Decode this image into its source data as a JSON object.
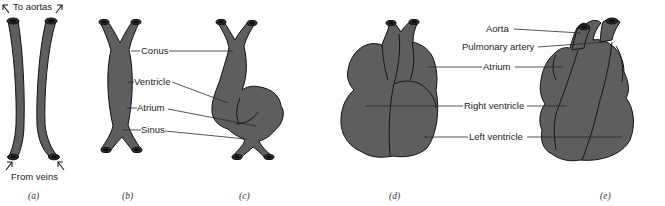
{
  "figure": {
    "panels": [
      {
        "id": "a",
        "caption": "(a)",
        "labels": {
          "top": "To aortas",
          "bottom": "From veins"
        }
      },
      {
        "id": "b",
        "caption": "(b)"
      },
      {
        "id": "c",
        "caption": "(c)"
      },
      {
        "id": "d",
        "caption": "(d)"
      },
      {
        "id": "e",
        "caption": "(e)"
      }
    ],
    "early_heart_labels": [
      "Conus",
      "Ventricle",
      "Atrium",
      "Sinus"
    ],
    "mature_heart_labels": [
      "Aorta",
      "Pulmonary artery",
      "Atrium",
      "Right ventricle",
      "Left ventricle"
    ],
    "colors": {
      "tissue": "#5e5e5e",
      "outline": "#111111",
      "background": "#ffffff"
    }
  }
}
